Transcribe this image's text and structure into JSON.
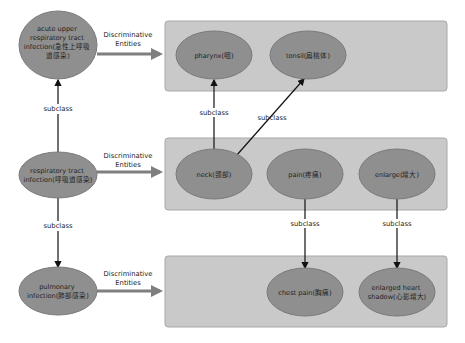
{
  "colors": {
    "panel_fill": "#c9c9c9",
    "node_fill": "#8f8f8f",
    "thick_arrow": "#7f7f7f",
    "thin_arrow": "#111111"
  },
  "diseases": [
    {
      "id": "d1",
      "lines": [
        "acute upper",
        "respiratory tract",
        "infection(急性上呼吸",
        "道感染)"
      ]
    },
    {
      "id": "d2",
      "lines": [
        "respiratory tract",
        "infection(呼吸道感染)"
      ]
    },
    {
      "id": "d3",
      "lines": [
        "pulmonary",
        "infection(肺部感染)"
      ]
    }
  ],
  "entities": [
    {
      "id": "e1",
      "lines": [
        "pharynx(咽)"
      ]
    },
    {
      "id": "e2",
      "lines": [
        "tonsil(扁桃体)"
      ]
    },
    {
      "id": "e3",
      "lines": [
        "neck(颈部)"
      ]
    },
    {
      "id": "e4",
      "lines": [
        "pain(疼痛)"
      ]
    },
    {
      "id": "e5",
      "lines": [
        "enlarge(增大)"
      ]
    },
    {
      "id": "e6",
      "lines": [
        "chest pain(胸痛)"
      ]
    },
    {
      "id": "e7",
      "lines": [
        "enlarged heart",
        "shadow(心影增大)"
      ]
    }
  ],
  "edge_labels": {
    "discriminative": [
      "Discriminative",
      "Entities"
    ],
    "subclass": "subclass"
  },
  "relations": [
    {
      "from": "d2",
      "to": "d1",
      "label": "subclass"
    },
    {
      "from": "d2",
      "to": "d3",
      "label": "subclass"
    },
    {
      "from": "e3",
      "to": "e1",
      "label": "subclass"
    },
    {
      "from": "e3",
      "to": "e2",
      "label": "subclass"
    },
    {
      "from": "e4",
      "to": "e6",
      "label": "subclass"
    },
    {
      "from": "e5",
      "to": "e7",
      "label": "subclass"
    },
    {
      "from": "d1",
      "to": "panel1",
      "label": "Discriminative Entities"
    },
    {
      "from": "d2",
      "to": "panel2",
      "label": "Discriminative Entities"
    },
    {
      "from": "d3",
      "to": "panel3",
      "label": "Discriminative Entities"
    }
  ]
}
